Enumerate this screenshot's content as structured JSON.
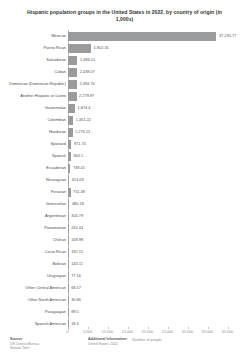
{
  "chart_data": {
    "type": "bar",
    "orientation": "horizontal",
    "title": "Hispanic population groups in the United States in 2022, by country of origin (in 1,000s)",
    "xlabel": "Number of people",
    "ylabel": "",
    "xlim": [
      0,
      40000
    ],
    "grid": false,
    "legend": null,
    "categories": [
      "Mexican",
      "Puerto Rican",
      "Salvadoran",
      "Cuban",
      "Dominican (Dominican Republic)",
      "Another Hispanic or Latino",
      "Guatemalan",
      "Colombian",
      "Honduran",
      "Spaniard",
      "Spanish",
      "Ecuadorian",
      "Nicaraguan",
      "Peruvian",
      "Venezuelan",
      "Argentinean",
      "Panamanian",
      "Chilean",
      "Costa Rican",
      "Bolivian",
      "Uruguayan",
      "Other Central American",
      "Other South American",
      "Paraguayan",
      "Spanish American"
    ],
    "values": [
      37235.77,
      5902.31,
      2486.51,
      2438.07,
      2394.74,
      2279.97,
      1874.4,
      1461.22,
      1276.21,
      971.74,
      844.1,
      738.41,
      413.09,
      751.38,
      480.18,
      304.79,
      242.44,
      168.98,
      192.15,
      143.11,
      77.16,
      68.57,
      30.86,
      89.5,
      18.4
    ],
    "value_labels": [
      "37,235.77",
      "5,902.31",
      "2,486.51",
      "2,438.07",
      "2,394.74",
      "2,279.97",
      "1,874.4",
      "1,461.22",
      "1,276.21",
      "971.74",
      "844.1",
      "738.41",
      "413.09",
      "751.38",
      "480.18",
      "304.79",
      "242.44",
      "168.98",
      "192.15",
      "143.11",
      "77.16",
      "68.57",
      "30.86",
      "89.5",
      "18.4"
    ],
    "xticks": [
      0,
      5000,
      10000,
      15000,
      20000,
      25000,
      30000,
      35000,
      40000
    ],
    "xtick_labels": [
      "0",
      "5,000",
      "10,000",
      "15,000",
      "20,000",
      "25,000",
      "30,000",
      "35,000",
      "40,000"
    ],
    "bar_color": "#9a9b9d"
  },
  "footer": {
    "source_head": "Source",
    "source_lines": [
      "US Census Bureau",
      "Statista Tech"
    ],
    "additional_head": "Additional Information:",
    "additional_lines": [
      "United States; 2022"
    ]
  }
}
